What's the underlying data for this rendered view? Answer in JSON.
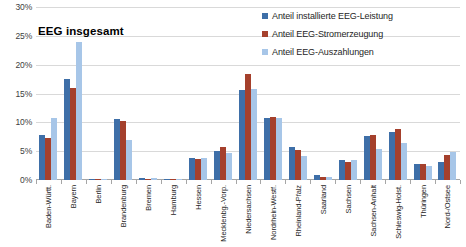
{
  "chart_data": {
    "type": "bar",
    "title": "EEG insgesamt",
    "xlabel": "",
    "ylabel": "",
    "ylim": [
      0,
      30
    ],
    "ytick_labels": [
      "30%",
      "25%",
      "20%",
      "15%",
      "10%",
      "5%",
      "0%"
    ],
    "ytick_values": [
      30,
      25,
      20,
      15,
      10,
      5,
      0
    ],
    "grid": true,
    "legend_position": "top-right",
    "value_unit": "%",
    "categories": [
      "Baden-Württ.",
      "Bayern",
      "Berlin",
      "Brandenburg",
      "Bremen",
      "Hamburg",
      "Hessen",
      "Mecklenbg.-Vorp.",
      "Niedersachsen",
      "Nordrhein-Westf.",
      "Rheinland-Pfalz",
      "Saarland",
      "Sachsen",
      "Sachsen-Anhalt",
      "Schleswig-Holst.",
      "Thüringen",
      "Nord-/Ostsee"
    ],
    "series": [
      {
        "name": "Anteil installierte EEG-Leistung",
        "color": "#3E6FA8",
        "values": [
          7.8,
          17.5,
          0.1,
          10.6,
          0.3,
          0.1,
          3.9,
          5.0,
          15.6,
          10.8,
          5.7,
          0.8,
          3.5,
          7.6,
          8.4,
          2.8,
          3.2
        ]
      },
      {
        "name": "Anteil EEG-Stromerzeugung",
        "color": "#A5402C",
        "values": [
          7.3,
          16.0,
          0.1,
          10.3,
          0.2,
          0.1,
          3.7,
          5.8,
          18.3,
          10.9,
          5.2,
          0.6,
          3.2,
          7.8,
          8.8,
          2.8,
          4.4
        ]
      },
      {
        "name": "Anteil EEG-Auszahlungen",
        "color": "#A7C6E8",
        "values": [
          10.8,
          24.0,
          0.1,
          7.0,
          0.3,
          0.1,
          3.9,
          4.7,
          15.8,
          10.7,
          4.2,
          0.6,
          3.4,
          5.3,
          6.5,
          2.4,
          4.8
        ]
      }
    ]
  }
}
